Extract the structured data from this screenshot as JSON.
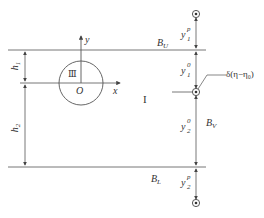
{
  "diagram": {
    "axes": {
      "x_label": "x",
      "y_label": "y",
      "origin_label": "O"
    },
    "regions": {
      "inner": "Ⅲ",
      "outer": "I"
    },
    "boundaries": {
      "upper": "B",
      "upper_sub": "U",
      "lower": "B",
      "lower_sub": "L",
      "vertical": "B",
      "vertical_sub": "V"
    },
    "dimensions": {
      "h1": {
        "base": "h",
        "sub": "1"
      },
      "h2": {
        "base": "h",
        "sub": "2"
      }
    },
    "vertical_segments": {
      "y1p": {
        "base": "y",
        "sub": "1",
        "sup": "p"
      },
      "y10": {
        "base": "y",
        "sub": "1",
        "sup": "0"
      },
      "y20": {
        "base": "y",
        "sub": "2",
        "sup": "0"
      },
      "y2p": {
        "base": "y",
        "sub": "2",
        "sup": "p"
      }
    },
    "source_label": "δ(η−η₀)",
    "colors": {
      "line": "#555555",
      "text": "#333333"
    }
  }
}
